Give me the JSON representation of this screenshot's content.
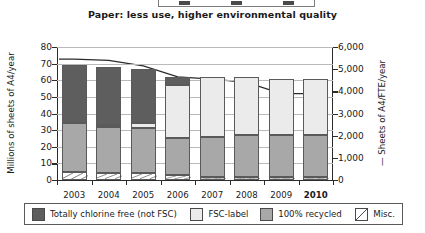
{
  "title": "Paper: less use, higher environmental quality",
  "top_legend": {
    "swatch_count": 3
  },
  "axes": {
    "left_label": "Millions of sheets of A4/year",
    "right_label": "— Sheets of A4/FTE/year",
    "left_ticks": [
      "80",
      "70",
      "60",
      "50",
      "40",
      "30",
      "20",
      "10",
      "0"
    ],
    "right_ticks": [
      "6,000",
      "5,000",
      "4,000",
      "3,000",
      "2,000",
      "1,000",
      "0"
    ]
  },
  "legend": {
    "items": [
      {
        "label": "Totally chlorine free (not FSC)",
        "key": "dark",
        "color": "#5e5e5e"
      },
      {
        "label": "FSC-label",
        "key": "fsc",
        "color": "#ebebeb"
      },
      {
        "label": "100% recycled",
        "key": "rec",
        "color": "#a8a8a8"
      },
      {
        "label": "Misc.",
        "key": "misc",
        "color": "#ffffff"
      }
    ]
  },
  "chart_data": {
    "type": "bar",
    "title": "Paper: less use, higher environmental quality",
    "xlabel": "",
    "ylabel": "Millions of sheets of A4/year",
    "y2label": "— Sheets of A4/FTE/year",
    "ylim": [
      0,
      80
    ],
    "y2lim": [
      0,
      6000
    ],
    "grid": true,
    "stacked": true,
    "legend_position": "bottom",
    "categories": [
      "2003",
      "2004",
      "2005",
      "2006",
      "2007",
      "2008",
      "2009",
      "2010"
    ],
    "highlighted_category": "2010",
    "series": [
      {
        "name": "Misc.",
        "values": [
          5,
          4,
          4,
          3,
          2,
          2,
          2,
          2
        ]
      },
      {
        "name": "100% recycled",
        "values": [
          29,
          28,
          27,
          22,
          24,
          25,
          25,
          25
        ]
      },
      {
        "name": "FSC-label",
        "values": [
          0,
          1,
          3,
          32,
          36,
          35,
          34,
          34
        ]
      },
      {
        "name": "Totally chlorine free (not FSC)",
        "values": [
          35,
          35,
          33,
          5,
          0,
          0,
          0,
          0
        ]
      }
    ],
    "totals": [
      69,
      68,
      67,
      62,
      62,
      62,
      61,
      61
    ],
    "line_series": {
      "name": "Sheets of A4/FTE/year",
      "axis": "right",
      "values": [
        5450,
        5400,
        5150,
        4650,
        4550,
        4400,
        3900,
        3900
      ]
    }
  }
}
